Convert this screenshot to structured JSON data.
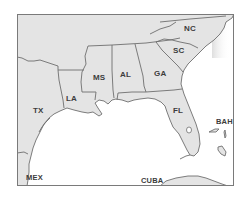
{
  "map": {
    "title": "Southeastern United States",
    "colors": {
      "land": "#e4e4e4",
      "water": "#ffffff",
      "border": "#6e6e6e",
      "frame": "#7a7a7a",
      "label": "#3c3c3c"
    },
    "labels": {
      "nc": "NC",
      "sc": "SC",
      "ga": "GA",
      "al": "AL",
      "ms": "MS",
      "la": "LA",
      "tx": "TX",
      "fl": "FL",
      "bah": "BAH",
      "mex": "MEX",
      "cuba": "CUBA"
    },
    "regions": [
      {
        "id": "nc",
        "name": "NC"
      },
      {
        "id": "sc",
        "name": "SC"
      },
      {
        "id": "ga",
        "name": "GA"
      },
      {
        "id": "al",
        "name": "AL"
      },
      {
        "id": "ms",
        "name": "MS"
      },
      {
        "id": "la",
        "name": "LA"
      },
      {
        "id": "tx",
        "name": "TX"
      },
      {
        "id": "fl",
        "name": "FL"
      },
      {
        "id": "bah",
        "name": "BAH"
      },
      {
        "id": "mex",
        "name": "MEX"
      },
      {
        "id": "cuba",
        "name": "CUBA"
      }
    ]
  }
}
